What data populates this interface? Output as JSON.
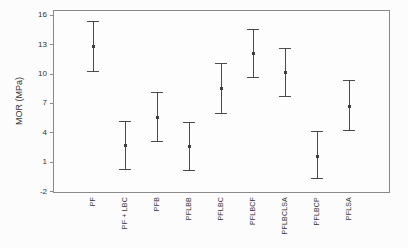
{
  "figure": {
    "background": "#fcfcfc",
    "frame_color": "#8a8a8a",
    "errorbar_color": "#4a4a4a",
    "marker_color": "#3d3d3d",
    "text_color": "#333333"
  },
  "chart_data": {
    "type": "scatter",
    "subtype": "mean-with-error-bars",
    "title": "",
    "xlabel": "",
    "ylabel": "MOR (MPa)",
    "categories": [
      "PF",
      "PF + LBC",
      "PFB",
      "PFLBB",
      "PFLBC",
      "PFLBCF",
      "PFLBCLSA",
      "PFLBCP",
      "PFLSA"
    ],
    "series": [
      {
        "name": "MOR",
        "mean": [
          12.8,
          2.6,
          5.5,
          2.5,
          8.5,
          12.1,
          10.1,
          1.5,
          6.6
        ],
        "upper": [
          15.4,
          5.2,
          8.1,
          5.1,
          11.1,
          14.6,
          12.6,
          4.1,
          9.3
        ],
        "lower": [
          10.2,
          0.1,
          3.0,
          0.0,
          5.9,
          9.5,
          7.6,
          -0.8,
          4.1
        ]
      }
    ],
    "yticks": [
      16,
      13,
      10,
      7,
      4,
      1,
      -2
    ],
    "ylim": [
      -2,
      16.5
    ],
    "grid": false,
    "legend": false
  }
}
